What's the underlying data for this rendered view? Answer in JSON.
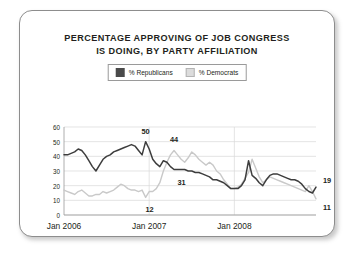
{
  "card": {
    "title_lines": [
      "PERCENTAGE APPROVING OF JOB CONGRESS",
      "IS DOING, BY PARTY AFFILIATION"
    ]
  },
  "legend": {
    "position": "top-center",
    "items": [
      {
        "label": "% Republicans",
        "swatch": "republican-swatch",
        "color": "#4a4a4a"
      },
      {
        "label": "% Democrats",
        "swatch": "democrat-swatch",
        "color": "#dcdcdc"
      }
    ]
  },
  "colors": {
    "republican_line": "#3d3d3d",
    "democrat_line": "#c9c9c9",
    "gridline": "#d8d8d8",
    "axis": "#9a9a9a",
    "text": "#231f20",
    "card_border": "#8d8d8d",
    "card_background": "#ffffff"
  },
  "chart_data": {
    "type": "line",
    "title": "PERCENTAGE APPROVING OF JOB CONGRESS IS DOING, BY PARTY AFFILIATION",
    "xlabel": "",
    "ylabel": "",
    "ylim": [
      0,
      60
    ],
    "yticks": [
      0,
      10,
      20,
      30,
      40,
      50,
      60
    ],
    "ytick_labels": [
      "0",
      "10",
      "20",
      "30",
      "40",
      "50",
      "60"
    ],
    "xticks": [
      0,
      24,
      48
    ],
    "xtick_labels": [
      "Jan 2006",
      "Jan 2007",
      "Jan 2008"
    ],
    "x_count": 72,
    "grid": true,
    "grid_axis": "both",
    "legend_position": "top-center",
    "series": [
      {
        "name": "% Republicans",
        "color": "#3d3d3d",
        "values": [
          41,
          41,
          42,
          43,
          45,
          44,
          41,
          37,
          33,
          30,
          34,
          38,
          40,
          41,
          43,
          44,
          45,
          46,
          47,
          48,
          47,
          44,
          41,
          50,
          45,
          38,
          35,
          33,
          37,
          36,
          33,
          31,
          31,
          31,
          31,
          30,
          30,
          29,
          29,
          28,
          27,
          26,
          24,
          24,
          23,
          22,
          20,
          18,
          18,
          18,
          20,
          24,
          37,
          27,
          25,
          22,
          20,
          24,
          27,
          28,
          28,
          27,
          26,
          25,
          24,
          24,
          23,
          21,
          18,
          16,
          15,
          19
        ]
      },
      {
        "name": "% Democrats",
        "color": "#c9c9c9",
        "values": [
          17,
          16,
          15,
          14,
          16,
          17,
          15,
          13,
          13,
          14,
          14,
          16,
          15,
          16,
          17,
          19,
          21,
          20,
          18,
          17,
          17,
          16,
          17,
          12,
          16,
          16,
          18,
          22,
          30,
          36,
          41,
          44,
          41,
          38,
          36,
          39,
          43,
          41,
          38,
          36,
          34,
          36,
          34,
          30,
          28,
          24,
          21,
          18,
          18,
          19,
          21,
          25,
          29,
          38,
          32,
          26,
          22,
          24,
          26,
          25,
          24,
          23,
          22,
          21,
          20,
          19,
          18,
          17,
          16,
          20,
          16,
          11
        ]
      }
    ],
    "annotations": [
      {
        "text": "50",
        "series": "% Republicans",
        "x": 23,
        "value": 50,
        "placement": "above"
      },
      {
        "text": "44",
        "series": "% Democrats",
        "x": 31,
        "value": 44,
        "placement": "above"
      },
      {
        "text": "31",
        "series": "% Republicans",
        "x": 32,
        "value": 31,
        "placement": "below"
      },
      {
        "text": "12",
        "series": "% Democrats",
        "x": 23,
        "value": 12,
        "placement": "below"
      },
      {
        "text": "19",
        "series": "% Republicans",
        "x": 71,
        "value": 19,
        "placement": "above-right"
      },
      {
        "text": "11",
        "series": "% Democrats",
        "x": 71,
        "value": 11,
        "placement": "below-right"
      }
    ]
  }
}
